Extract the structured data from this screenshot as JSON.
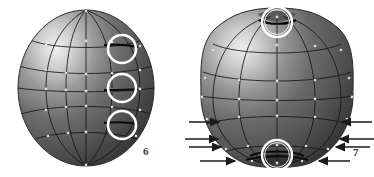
{
  "figure": {
    "background_color": "#ffffff",
    "sphere_dark": "#3e3e3e",
    "sphere_mid": "#6e6e6e",
    "sphere_light": "#e8e8e8",
    "wire_color": "#1b1b1b",
    "highlight_ring_color": "#ffffff",
    "arrow_color": "#1b1b1b",
    "cropped_top_text": "",
    "panels": [
      {
        "id": "panel-left",
        "caption": "6",
        "caption_position": {
          "x": 143,
          "y": 146
        },
        "sphere": {
          "name": "undeformed-sphere",
          "center": {
            "x": 86,
            "y": 88
          },
          "radius_x": 68,
          "radius_y": 78,
          "meridian_count": 5,
          "latitude_count": 5,
          "deformed": "false"
        },
        "highlight_circles": [
          {
            "name": "highlight-circle-top",
            "cx": 122,
            "cy": 49,
            "r": 14
          },
          {
            "name": "highlight-circle-middle",
            "cx": 122,
            "cy": 88,
            "r": 14
          },
          {
            "name": "highlight-circle-bottom",
            "cx": 122,
            "cy": 125,
            "r": 14
          }
        ],
        "arrows": []
      },
      {
        "id": "panel-right",
        "caption": "7",
        "caption_position": {
          "x": 353,
          "y": 147
        },
        "sphere": {
          "name": "deformed-sphere",
          "center": {
            "x": 277,
            "y": 88
          },
          "radius_x": 76,
          "radius_y": 80,
          "meridian_count": 5,
          "latitude_count": 5,
          "deformed": "true",
          "deformation": "poles pinched inward"
        },
        "highlight_circles": [
          {
            "name": "highlight-circle-north-pole",
            "cx": 277,
            "cy": 22,
            "r": 15
          },
          {
            "name": "highlight-circle-south-pole",
            "cx": 277,
            "cy": 155,
            "r": 15
          }
        ],
        "arrows": [
          {
            "name": "force-arrow-left-1",
            "x1": 189,
            "y1": 122,
            "x2": 222,
            "y2": 122,
            "direction": "right"
          },
          {
            "name": "force-arrow-left-2",
            "x1": 185,
            "y1": 139,
            "x2": 221,
            "y2": 139,
            "direction": "right"
          },
          {
            "name": "force-arrow-left-3",
            "x1": 189,
            "y1": 147,
            "x2": 224,
            "y2": 147,
            "direction": "right"
          },
          {
            "name": "force-arrow-left-4",
            "x1": 200,
            "y1": 161,
            "x2": 238,
            "y2": 161,
            "direction": "right"
          },
          {
            "name": "force-arrow-right-1",
            "x1": 372,
            "y1": 122,
            "x2": 339,
            "y2": 122,
            "direction": "left"
          },
          {
            "name": "force-arrow-right-2",
            "x1": 374,
            "y1": 139,
            "x2": 337,
            "y2": 139,
            "direction": "left"
          },
          {
            "name": "force-arrow-right-3",
            "x1": 370,
            "y1": 147,
            "x2": 333,
            "y2": 147,
            "direction": "left"
          },
          {
            "name": "force-arrow-right-4",
            "x1": 350,
            "y1": 161,
            "x2": 316,
            "y2": 161,
            "direction": "left"
          }
        ]
      }
    ]
  }
}
